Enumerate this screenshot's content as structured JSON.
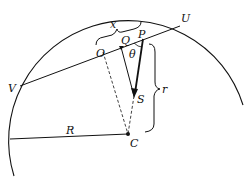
{
  "diagram": {
    "type": "geometry",
    "labels": {
      "x": "x",
      "U": "U",
      "V": "V",
      "O": "O",
      "Q": "Q",
      "P": "P",
      "theta": "θ",
      "S": "S",
      "r": "r",
      "R": "R",
      "C": "C"
    },
    "colors": {
      "line": "#111111",
      "background": "#ffffff"
    }
  }
}
